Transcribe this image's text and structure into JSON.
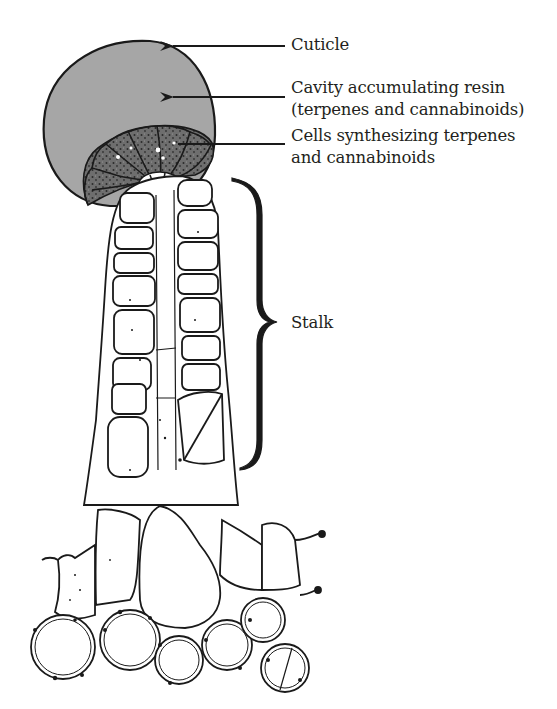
{
  "figure": {
    "colors": {
      "head_fill": "#a6a6a6",
      "cells_fill": "#6e6e6e",
      "outline": "#1a1a1a",
      "background": "#ffffff",
      "text": "#231f20"
    }
  },
  "labels": {
    "cuticle": "Cuticle",
    "cavity_line1": "Cavity accumulating resin",
    "cavity_line2": "(terpenes and cannabinoids)",
    "cells_line1": "Cells synthesizing terpenes",
    "cells_line2": "and cannabinoids",
    "stalk": "Stalk"
  },
  "annotations": [
    {
      "id": "cuticle",
      "type": "arrow",
      "target": "outer head boundary"
    },
    {
      "id": "cavity",
      "type": "arrow",
      "target": "grey resin cavity"
    },
    {
      "id": "cells",
      "type": "line",
      "target": "dark secretory cells"
    },
    {
      "id": "stalk",
      "type": "brace",
      "target": "multicellular stalk"
    }
  ]
}
